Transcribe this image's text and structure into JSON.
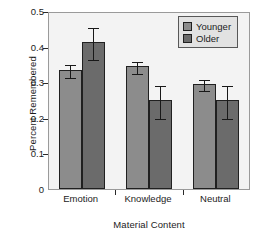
{
  "chart_data": {
    "type": "bar",
    "title": "",
    "xlabel": "Material Content",
    "ylabel": "Percent Remembered",
    "categories": [
      "Emotion",
      "Knowledge",
      "Neutral"
    ],
    "ylim": [
      0,
      0.5
    ],
    "yticks": [
      "0",
      "0.1",
      "0.2",
      "0.3",
      "0.4",
      "0.5"
    ],
    "ytick_values": [
      0,
      0.1,
      0.2,
      0.3,
      0.4,
      0.5
    ],
    "grid": false,
    "legend_position": "top-right",
    "series": [
      {
        "name": "Younger",
        "color": "#8c8c8c",
        "values": [
          0.335,
          0.345,
          0.295
        ],
        "errors_low": [
          0.02,
          0.018,
          0.018
        ],
        "errors_high": [
          0.02,
          0.018,
          0.018
        ]
      },
      {
        "name": "Older",
        "color": "#6b6b6b",
        "values": [
          0.412,
          0.249,
          0.249
        ],
        "errors_low": [
          0.047,
          0.049,
          0.049
        ],
        "errors_high": [
          0.047,
          0.046,
          0.046
        ]
      }
    ]
  },
  "legend": {
    "items": [
      {
        "label": "Younger",
        "swatch": "younger"
      },
      {
        "label": "Older",
        "swatch": "older"
      }
    ]
  }
}
